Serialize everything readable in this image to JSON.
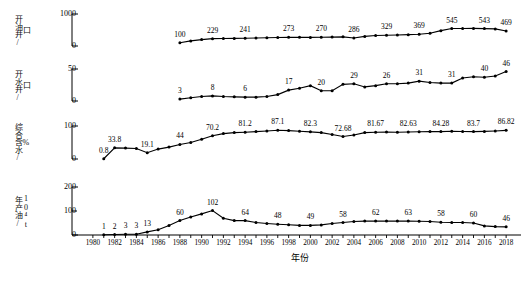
{
  "chart_data": {
    "type": "line",
    "title": "",
    "xlabel": "年份",
    "x_ticks": [
      1980,
      1982,
      1984,
      1986,
      1988,
      1990,
      1992,
      1994,
      1996,
      1998,
      2000,
      2002,
      2004,
      2006,
      2008,
      2010,
      2012,
      2014,
      2016,
      2018
    ],
    "x_range": [
      1979,
      2019
    ],
    "grid": false,
    "legend": "none",
    "panels": [
      {
        "name": "oil-wells",
        "ylabel": "开油井/",
        "yunit": "口",
        "ylim": [
          0,
          1000
        ],
        "yticks": [
          0,
          1000
        ],
        "ytick_labels": [
          "0",
          "1000"
        ],
        "x": [
          1988,
          1989,
          1990,
          1991,
          1992,
          1993,
          1994,
          1995,
          1996,
          1997,
          1998,
          1999,
          2000,
          2001,
          2002,
          2003,
          2004,
          2005,
          2006,
          2007,
          2008,
          2009,
          2010,
          2011,
          2012,
          2013,
          2014,
          2015,
          2016,
          2017,
          2018
        ],
        "values": [
          100,
          160,
          200,
          229,
          233,
          238,
          241,
          250,
          258,
          266,
          273,
          270,
          268,
          272,
          278,
          286,
          250,
          300,
          329,
          335,
          345,
          355,
          369,
          400,
          480,
          545,
          548,
          550,
          543,
          535,
          469
        ],
        "labels": [
          {
            "year": 1988,
            "text": "100"
          },
          {
            "year": 1991,
            "text": "229"
          },
          {
            "year": 1994,
            "text": "241"
          },
          {
            "year": 1998,
            "text": "273"
          },
          {
            "year": 2001,
            "text": "270"
          },
          {
            "year": 2004,
            "text": "286"
          },
          {
            "year": 2007,
            "text": "329"
          },
          {
            "year": 2010,
            "text": "369"
          },
          {
            "year": 2013,
            "text": "545"
          },
          {
            "year": 2016,
            "text": "543"
          },
          {
            "year": 2018,
            "text": "469"
          }
        ]
      },
      {
        "name": "water-wells",
        "ylabel": "开水井/",
        "yunit": "口",
        "ylim": [
          0,
          50
        ],
        "yticks": [
          0,
          50
        ],
        "ytick_labels": [
          "0",
          "50"
        ],
        "x": [
          1988,
          1989,
          1990,
          1991,
          1992,
          1993,
          1994,
          1995,
          1996,
          1997,
          1998,
          1999,
          2000,
          2001,
          2002,
          2003,
          2004,
          2005,
          2006,
          2007,
          2008,
          2009,
          2010,
          2011,
          2012,
          2013,
          2014,
          2015,
          2016,
          2017,
          2018
        ],
        "values": [
          3,
          5,
          7,
          8,
          7,
          6.5,
          6,
          6,
          7,
          10,
          17,
          20,
          24,
          16,
          16,
          26,
          27,
          22,
          24,
          27,
          27,
          28,
          31,
          29,
          28,
          28,
          36,
          38,
          37,
          39,
          46
        ],
        "labels": [
          {
            "year": 1988,
            "text": "3"
          },
          {
            "year": 1991,
            "text": "8"
          },
          {
            "year": 1994,
            "text": "6"
          },
          {
            "year": 1998,
            "text": "17"
          },
          {
            "year": 2001,
            "text": "20"
          },
          {
            "year": 2004,
            "text": "29"
          },
          {
            "year": 2007,
            "text": "26"
          },
          {
            "year": 2010,
            "text": "31"
          },
          {
            "year": 2013,
            "text": "31"
          },
          {
            "year": 2016,
            "text": "40"
          },
          {
            "year": 2018,
            "text": "46"
          }
        ]
      },
      {
        "name": "water-cut",
        "ylabel": "综合含水/",
        "yunit": "%",
        "ylim": [
          0,
          100
        ],
        "yticks": [
          0,
          100
        ],
        "ytick_labels": [
          "0",
          "100"
        ],
        "x": [
          1981,
          1982,
          1983,
          1984,
          1985,
          1986,
          1987,
          1988,
          1989,
          1990,
          1991,
          1992,
          1993,
          1994,
          1995,
          1996,
          1997,
          1998,
          1999,
          2000,
          2001,
          2002,
          2003,
          2004,
          2005,
          2006,
          2007,
          2008,
          2009,
          2010,
          2011,
          2012,
          2013,
          2014,
          2015,
          2016,
          2017,
          2018
        ],
        "values": [
          0.8,
          33.8,
          33,
          32,
          19.1,
          30,
          36,
          44,
          50,
          60,
          70.2,
          77,
          80,
          81.2,
          83,
          85,
          87.1,
          86,
          84,
          82.3,
          80,
          74,
          68,
          72.68,
          80,
          81,
          81.67,
          81,
          82,
          82.63,
          83,
          83,
          84.28,
          83.5,
          83,
          83.7,
          85,
          86.82
        ],
        "labels": [
          {
            "year": 1981,
            "text": "0.8"
          },
          {
            "year": 1982,
            "text": "33.8"
          },
          {
            "year": 1985,
            "text": "19.1"
          },
          {
            "year": 1988,
            "text": "44"
          },
          {
            "year": 1991,
            "text": "70.2"
          },
          {
            "year": 1994,
            "text": "81.2"
          },
          {
            "year": 1997,
            "text": "87.1"
          },
          {
            "year": 2000,
            "text": "82.3"
          },
          {
            "year": 2003,
            "text": "72.68"
          },
          {
            "year": 2006,
            "text": "81.67"
          },
          {
            "year": 2009,
            "text": "82.63"
          },
          {
            "year": 2012,
            "text": "84.28"
          },
          {
            "year": 2015,
            "text": "83.7"
          },
          {
            "year": 2018,
            "text": "86.82"
          }
        ]
      },
      {
        "name": "annual-oil-production",
        "ylabel": "年产油/",
        "yunit": "10⁴t",
        "ylim": [
          0,
          200
        ],
        "yticks": [
          0,
          100,
          200
        ],
        "ytick_labels": [
          "0",
          "100",
          "200"
        ],
        "x": [
          1981,
          1982,
          1983,
          1984,
          1985,
          1986,
          1987,
          1988,
          1989,
          1990,
          1991,
          1992,
          1993,
          1994,
          1995,
          1996,
          1997,
          1998,
          1999,
          2000,
          2001,
          2002,
          2003,
          2004,
          2005,
          2006,
          2007,
          2008,
          2009,
          2010,
          2011,
          2012,
          2013,
          2014,
          2015,
          2016,
          2017,
          2018
        ],
        "values": [
          1,
          2,
          3,
          3,
          13,
          22,
          40,
          60,
          75,
          88,
          102,
          70,
          60,
          60,
          52,
          48,
          45,
          43,
          40,
          40,
          42,
          48,
          52,
          56,
          58,
          58,
          58,
          58,
          58,
          57,
          56,
          53,
          52,
          52,
          50,
          38,
          35,
          34
        ],
        "labels": [
          {
            "year": 1981,
            "text": "1"
          },
          {
            "year": 1982,
            "text": "2"
          },
          {
            "year": 1983,
            "text": "3"
          },
          {
            "year": 1984,
            "text": "3"
          },
          {
            "year": 1985,
            "text": "13"
          },
          {
            "year": 1988,
            "text": "60"
          },
          {
            "year": 1991,
            "text": "102"
          },
          {
            "year": 1994,
            "text": "64"
          },
          {
            "year": 1997,
            "text": "48"
          },
          {
            "year": 2000,
            "text": "49"
          },
          {
            "year": 2003,
            "text": "58"
          },
          {
            "year": 2006,
            "text": "62"
          },
          {
            "year": 2009,
            "text": "63"
          },
          {
            "year": 2012,
            "text": "58"
          },
          {
            "year": 2015,
            "text": "60"
          },
          {
            "year": 2018,
            "text": "46"
          }
        ]
      }
    ]
  }
}
